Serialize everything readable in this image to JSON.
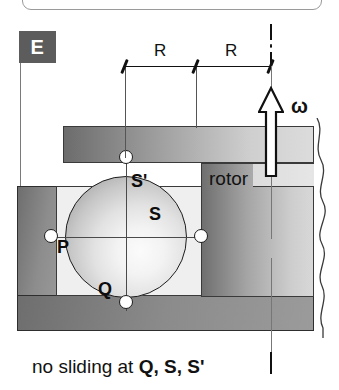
{
  "diagram": {
    "title": "no sliding at Q, S, S'",
    "labels": {
      "stator": "E",
      "rotor": "rotor",
      "omega": "ω",
      "axis_marker": "i"
    },
    "dimensions": [
      {
        "name": "radius-left",
        "label": "R"
      },
      {
        "name": "radius-right",
        "label": "R"
      }
    ],
    "contact_points": [
      {
        "id": "S-prime",
        "label": "S'",
        "position": "top-inner"
      },
      {
        "id": "S",
        "label": "S",
        "position": "right-inner"
      },
      {
        "id": "P",
        "label": "P",
        "position": "left-lower"
      },
      {
        "id": "Q",
        "label": "Q",
        "position": "bottom-inner"
      }
    ],
    "caption": {
      "prefix": "no sliding at ",
      "points": "Q, S, S'",
      "axis_glyph": "i"
    },
    "colors": {
      "housing_dark": "#5c5c5c",
      "sphere_light": "#f3f3f3",
      "outline": "#1d1d1d",
      "dot_fill": "#ffffff",
      "text": "#111111"
    }
  }
}
